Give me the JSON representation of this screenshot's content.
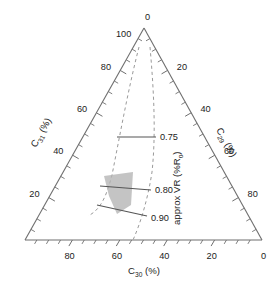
{
  "chart_data": {
    "type": "scatter",
    "subtype": "ternary-diagram",
    "title": "",
    "grid": false,
    "legend_position": "none",
    "axes": {
      "left": {
        "label": "C31 (%)",
        "label_base": "C",
        "label_sub": "31",
        "label_unit": " (%)",
        "ticks": [
          20,
          40,
          60,
          80,
          100
        ],
        "tick_labels": [
          "20",
          "40",
          "60",
          "80",
          "100"
        ],
        "minor_step": 5,
        "range": [
          0,
          100
        ],
        "direction": "bottom-left-to-apex"
      },
      "right": {
        "label": "C29 (%)",
        "label_base": "C",
        "label_sub": "29",
        "label_unit": " (%)",
        "ticks": [
          0,
          20,
          40,
          60,
          80
        ],
        "tick_labels": [
          "0",
          "20",
          "40",
          "60",
          "80"
        ],
        "minor_step": 5,
        "range": [
          0,
          100
        ],
        "direction": "apex-to-bottom-right"
      },
      "bottom": {
        "label": "C30 (%)",
        "label_base": "C",
        "label_sub": "30",
        "label_unit": " (%)",
        "ticks": [
          0,
          20,
          40,
          60,
          80
        ],
        "tick_labels": [
          "80",
          "60",
          "40",
          "20",
          "0"
        ],
        "minor_step": 5,
        "range": [
          0,
          100
        ],
        "direction": "right-to-left"
      }
    },
    "apex_labels": {
      "left_of_apex": "100",
      "right_of_apex": "0"
    },
    "maturity_axis_title": "approx VR (%Ro)",
    "maturity_axis_title_base": "approx VR (%R",
    "maturity_axis_title_sub": "o",
    "maturity_axis_title_tail": ")",
    "iso_lines": [
      {
        "label": "0.75",
        "value": 0.75
      },
      {
        "label": "0.80",
        "value": 0.8
      },
      {
        "label": "0.90",
        "value": 0.9
      }
    ],
    "shaded_region": {
      "name": "sample-field",
      "color": "#b4b4b4",
      "description": "shaded sample field between 0.80 and 0.90 isolines"
    },
    "envelope": {
      "name": "maturity-envelope",
      "style": "dashed",
      "color": "#9a9a9a",
      "count": 2
    },
    "colors": {
      "axis": "#6e6e6e",
      "iso": "#555555",
      "dashed": "#9a9a9a",
      "shade": "#b4b4b4",
      "text": "#1b1b1b",
      "background": "#ffffff"
    }
  }
}
